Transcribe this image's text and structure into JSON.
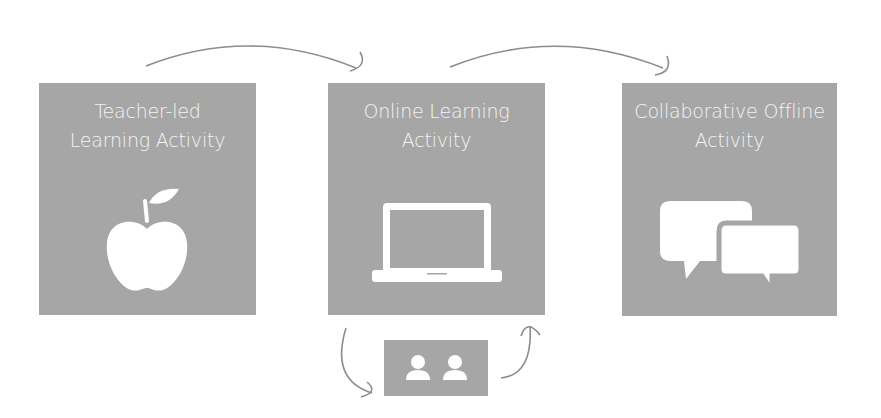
{
  "diagram": {
    "steps": [
      {
        "id": "teacher-led",
        "title_lines": [
          "Teacher-led",
          "Learning Activity"
        ],
        "icon": "apple-icon"
      },
      {
        "id": "online",
        "title_lines": [
          "Online Learning",
          "Activity"
        ],
        "icon": "laptop-icon"
      },
      {
        "id": "collaborative",
        "title_lines": [
          "Collaborative Offline",
          "Activity"
        ],
        "icon": "speech-bubbles-icon"
      }
    ],
    "sub_step": {
      "id": "peer-pair",
      "icon": "two-users-icon"
    },
    "arrows": [
      {
        "from": "teacher-led",
        "to": "online"
      },
      {
        "from": "online",
        "to": "collaborative"
      },
      {
        "from": "online",
        "to": "peer-pair"
      },
      {
        "from": "peer-pair",
        "to": "online"
      }
    ],
    "colors": {
      "box": "#a6a6a6",
      "icon": "#ffffff",
      "arrow": "#8c8c8c",
      "text": "#f4f4f4"
    }
  }
}
